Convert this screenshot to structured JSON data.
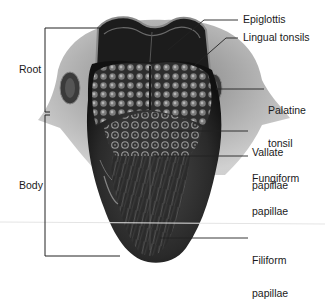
{
  "diagram": {
    "labels_right": [
      {
        "id": "epiglottis",
        "text": "Epiglottis"
      },
      {
        "id": "lingual-tonsils",
        "text": "Lingual tonsils"
      },
      {
        "id": "palatine-tonsil",
        "line1": "Palatine",
        "line2": "tonsil"
      },
      {
        "id": "vallate-papillae",
        "line1": "Vallate",
        "line2": "papillae"
      },
      {
        "id": "fungiform-papillae",
        "line1": "Fungiform",
        "line2": "papillae"
      },
      {
        "id": "filiform-papillae",
        "line1": "Filiform",
        "line2": "papillae"
      }
    ],
    "labels_left": [
      {
        "id": "root",
        "text": "Root"
      },
      {
        "id": "body",
        "text": "Body"
      }
    ],
    "colors": {
      "background": "#ffffff",
      "text": "#1a1a1a",
      "leader_line": "#222222",
      "tongue_dark": "#1e1e1e",
      "tongue_mid": "#4a4a4a",
      "tissue_light": "#9a9a9a"
    }
  }
}
